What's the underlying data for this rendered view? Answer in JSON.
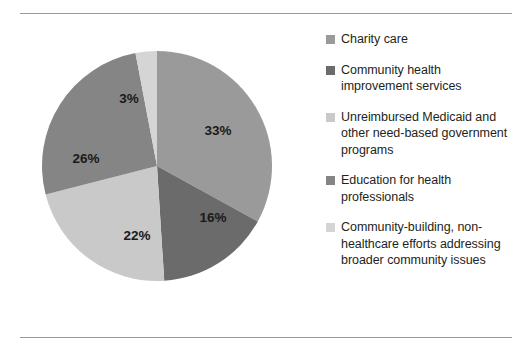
{
  "chart_data": {
    "type": "pie",
    "title": "",
    "subtitle": "",
    "xlabel": "",
    "ylabel": "",
    "legend_position": "right",
    "start_angle_deg": 0,
    "direction": "clockwise",
    "categories": [
      "Charity care",
      "Community health improvement services",
      "Unreimbursed Medicaid and other need-based government programs",
      "Education for health professionals",
      "Community-building, non-healthcare efforts addressing broader community issues"
    ],
    "values": [
      33,
      16,
      22,
      26,
      3
    ],
    "value_labels": [
      "33%",
      "16%",
      "22%",
      "26%",
      "3%"
    ],
    "colors": [
      "#9a9a9a",
      "#6b6b6b",
      "#c9c9c9",
      "#858585",
      "#d5d5d5"
    ],
    "units": "percent",
    "total": 100
  },
  "slices": [
    {
      "label": "33%",
      "value": 33,
      "color": "#9a9a9a",
      "lx": 188,
      "ly": 93
    },
    {
      "label": "16%",
      "value": 16,
      "color": "#6b6b6b",
      "lx": 183,
      "ly": 180
    },
    {
      "label": "22%",
      "value": 22,
      "color": "#c9c9c9",
      "lx": 107,
      "ly": 198
    },
    {
      "label": "26%",
      "value": 26,
      "color": "#858585",
      "lx": 56,
      "ly": 121
    },
    {
      "label": "3%",
      "value": 3,
      "color": "#d5d5d5",
      "lx": 99,
      "ly": 61
    }
  ],
  "legend": {
    "items": [
      {
        "label": "Charity care",
        "color": "#9a9a9a"
      },
      {
        "label": "Community health improvement services",
        "color": "#6b6b6b"
      },
      {
        "label": "Unreimbursed Medicaid and other need-based government programs",
        "color": "#c9c9c9"
      },
      {
        "label": "Education for health professionals",
        "color": "#858585"
      },
      {
        "label": "Community-building, non-healthcare efforts addressing broader community issues",
        "color": "#d5d5d5"
      }
    ]
  },
  "rules": {
    "top_color": "#9a9a9a",
    "bottom_color": "#9a9a9a"
  }
}
